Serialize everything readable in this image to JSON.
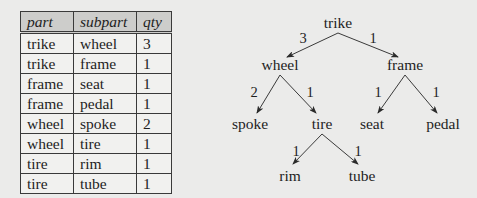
{
  "table": {
    "columns": [
      "part",
      "subpart",
      "qty"
    ],
    "rows": [
      [
        "trike",
        "wheel",
        "3"
      ],
      [
        "trike",
        "frame",
        "1"
      ],
      [
        "frame",
        "seat",
        "1"
      ],
      [
        "frame",
        "pedal",
        "1"
      ],
      [
        "wheel",
        "spoke",
        "2"
      ],
      [
        "wheel",
        "tire",
        "1"
      ],
      [
        "tire",
        "rim",
        "1"
      ],
      [
        "tire",
        "tube",
        "1"
      ]
    ]
  },
  "tree": {
    "nodes": {
      "trike": "trike",
      "wheel": "wheel",
      "frame": "frame",
      "spoke": "spoke",
      "tire": "tire",
      "seat": "seat",
      "pedal": "pedal",
      "rim": "rim",
      "tube": "tube"
    },
    "edges": {
      "trike_wheel": "3",
      "trike_frame": "1",
      "wheel_spoke": "2",
      "wheel_tire": "1",
      "frame_seat": "1",
      "frame_pedal": "1",
      "tire_rim": "1",
      "tire_tube": "1"
    }
  },
  "colors": {
    "background": "#ebebea",
    "header_fill": "#cdcdcb",
    "ink": "#1e1e1e"
  }
}
